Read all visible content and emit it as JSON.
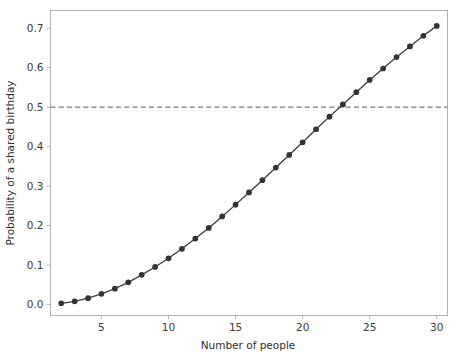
{
  "chart_data": {
    "type": "line",
    "title": "",
    "subtitle": "",
    "xlabel": "Number of people",
    "ylabel": "Probability of a shared birthday",
    "xlim": [
      1.2,
      30.8
    ],
    "ylim": [
      -0.028,
      0.745
    ],
    "xticks": [
      5,
      10,
      15,
      20,
      25,
      30
    ],
    "xtick_labels": [
      "5",
      "10",
      "15",
      "20",
      "25",
      "30"
    ],
    "yticks": [
      0.0,
      0.1,
      0.2,
      0.3,
      0.4,
      0.5,
      0.6,
      0.7
    ],
    "ytick_labels": [
      "0.0",
      "0.1",
      "0.2",
      "0.3",
      "0.4",
      "0.5",
      "0.6",
      "0.7"
    ],
    "grid": false,
    "legend": false,
    "legend_position": "none",
    "x": [
      2,
      3,
      4,
      5,
      6,
      7,
      8,
      9,
      10,
      11,
      12,
      13,
      14,
      15,
      16,
      17,
      18,
      19,
      20,
      21,
      22,
      23,
      24,
      25,
      26,
      27,
      28,
      29,
      30
    ],
    "series": [
      {
        "name": "Probability of a shared birthday",
        "marker": "circle",
        "color": "#333333",
        "values": [
          0.003,
          0.008,
          0.016,
          0.027,
          0.04,
          0.056,
          0.075,
          0.095,
          0.117,
          0.141,
          0.167,
          0.194,
          0.223,
          0.253,
          0.284,
          0.315,
          0.347,
          0.379,
          0.411,
          0.444,
          0.476,
          0.507,
          0.538,
          0.569,
          0.598,
          0.627,
          0.654,
          0.681,
          0.706
        ]
      }
    ],
    "annotations": [
      {
        "type": "hline",
        "name": "half-probability-threshold",
        "y": 0.5,
        "style": "dashed",
        "color": "#7a7a7a",
        "label": ""
      }
    ],
    "colors": {
      "line": "#3b3b3b",
      "marker": "#333333",
      "threshold": "#7a7a7a",
      "spine": "#b4b4b4",
      "text": "#3a3a3a",
      "background": "#ffffff"
    }
  }
}
